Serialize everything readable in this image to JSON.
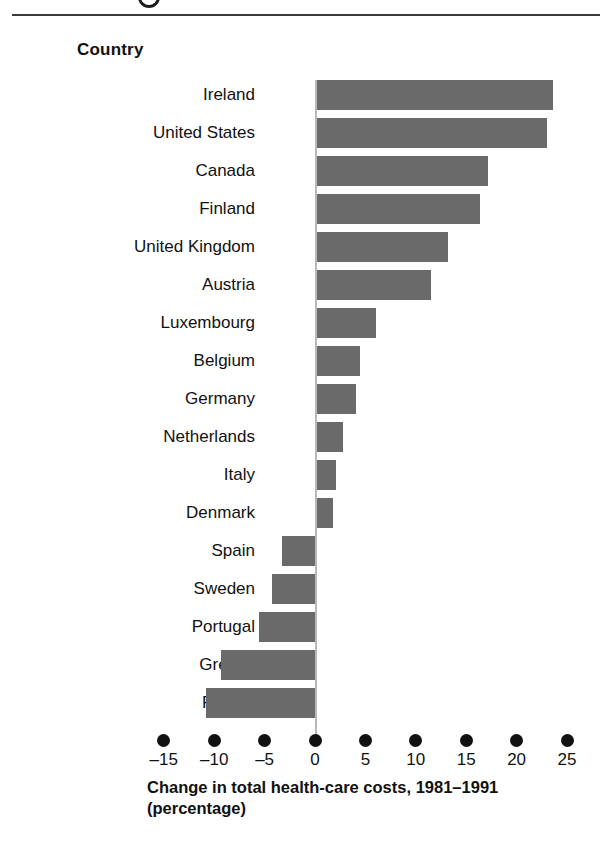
{
  "figure": {
    "rule_visible": true,
    "partial_glyph": "figure-number-circle"
  },
  "header": {
    "column_label": "Country"
  },
  "axis": {
    "title_line1": "Change in total health-care costs, 1981–1991",
    "title_line2": "(percentage)",
    "tick_labels": [
      "–15",
      "–10",
      "–5",
      "0",
      "5",
      "10",
      "15",
      "20",
      "25"
    ],
    "tick_values": [
      -15,
      -10,
      -5,
      0,
      5,
      10,
      15,
      20,
      25
    ]
  },
  "colors": {
    "bar": "#6a6a6a",
    "rule": "#3b3b3b",
    "zero_line": "#b9b9b9",
    "text": "#111111",
    "background": "#ffffff"
  },
  "chart_data": {
    "type": "bar",
    "orientation": "horizontal",
    "title": "",
    "xlabel": "Change in total health-care costs, 1981–1991 (percentage)",
    "ylabel": "Country",
    "xlim": [
      -15,
      25
    ],
    "grid": false,
    "legend": false,
    "categories": [
      "Ireland",
      "United States",
      "Canada",
      "Finland",
      "United Kingdom",
      "Austria",
      "Luxembourg",
      "Belgium",
      "Germany",
      "Netherlands",
      "Italy",
      "Denmark",
      "Spain",
      "Sweden",
      "Portugal",
      "Greece",
      "France"
    ],
    "values": [
      23.6,
      23.0,
      17.2,
      16.4,
      13.2,
      11.5,
      6.1,
      4.5,
      4.1,
      2.8,
      2.1,
      1.8,
      -3.3,
      -4.3,
      -5.6,
      -9.3,
      -10.8
    ]
  }
}
